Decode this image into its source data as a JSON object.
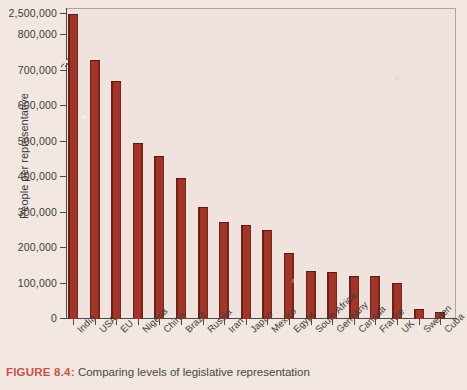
{
  "figure": {
    "number_label": "FIGURE 8.4:",
    "caption": "Comparing levels of legislative representation"
  },
  "axis": {
    "ylabel": "People per representative",
    "xlabel": "",
    "ytick_labels": [
      "0",
      "100,000",
      "200,000",
      "300,000",
      "400,000",
      "500,000",
      "600,000",
      "700,000",
      "800,000",
      "2,500,000"
    ],
    "break_note": "axis break between 800,000 and 2,500,000"
  },
  "colors": {
    "bar": "#a0352a",
    "bar_edge": "#6f1f16",
    "plot_background": "#f0e2dc",
    "page_background": "#f3e7e1",
    "axis": "#4a4a4a",
    "caption_accent": "#c4554a",
    "text": "#3b3b3b"
  },
  "chart_data": {
    "type": "bar",
    "title": "Comparing levels of legislative representation",
    "xlabel": "",
    "ylabel": "People per representative",
    "ylim": [
      0,
      800000
    ],
    "grid": false,
    "legend": "none",
    "axis_break": {
      "from": 800000,
      "to": 2500000
    },
    "categories": [
      "India",
      "USA",
      "EU",
      "Nigeria",
      "China",
      "Brazil",
      "Russia",
      "Iran",
      "Japan",
      "Mexico",
      "Egypt",
      "South Africa",
      "Germany",
      "Canada",
      "France",
      "UK",
      "Sweden",
      "Cuba"
    ],
    "values": [
      2500000,
      730000,
      670000,
      495000,
      458000,
      396000,
      315000,
      272000,
      265000,
      252000,
      186000,
      134000,
      133000,
      121000,
      121000,
      102000,
      28000,
      21000
    ]
  }
}
